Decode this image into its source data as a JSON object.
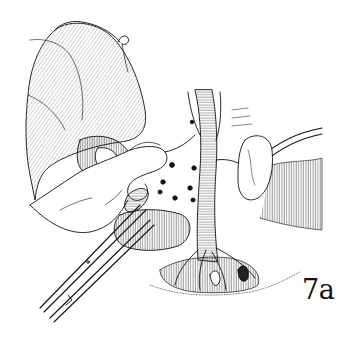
{
  "figure": {
    "label": "7a",
    "style": "black-and-white surgical line illustration",
    "colors": {
      "ink": "#111111",
      "background": "#ffffff"
    },
    "elements": [
      "retracted-organ",
      "surgeon-hand",
      "scissors",
      "aorta",
      "vessel-branches",
      "surgical-clips",
      "drain-tube",
      "tissue-flap"
    ]
  }
}
